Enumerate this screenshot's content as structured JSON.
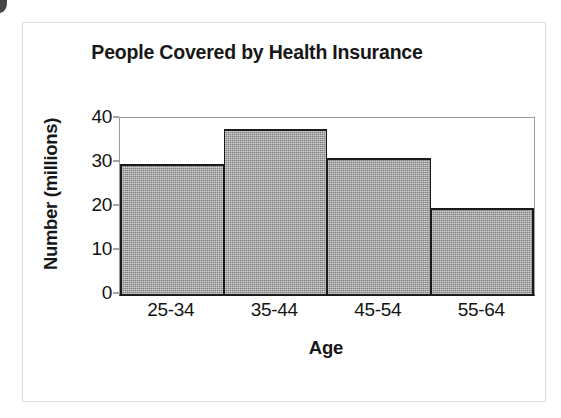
{
  "figure": {
    "corner_mark_name": "scan-corner-mark",
    "page_border_name": "page-border"
  },
  "chart_data": {
    "type": "bar",
    "title": "People Covered by Health Insurance",
    "xlabel": "Age",
    "ylabel": "Number (millions)",
    "categories": [
      "25-34",
      "35-44",
      "45-54",
      "55-64"
    ],
    "values": [
      29.5,
      37.5,
      30.8,
      19.5
    ],
    "series": [
      {
        "name": "People covered",
        "values": [
          29.5,
          37.5,
          30.8,
          19.5
        ]
      }
    ],
    "ylim": [
      0,
      40
    ],
    "yticks": [
      0,
      10,
      20,
      30,
      40
    ],
    "ytick_labels": [
      "0",
      "10",
      "20",
      "30",
      "40"
    ],
    "xtick_labels": [
      "25-34",
      "35-44",
      "45-54",
      "55-64"
    ],
    "grid": false,
    "legend": false,
    "legend_position": "none",
    "bar_fill_color": "#9e9e9e",
    "bar_edge_color": "#1b1b1b",
    "axis_color": "#1c1c1c",
    "plot_background": "#ffffff",
    "bar_gap": 0,
    "annotations": []
  }
}
